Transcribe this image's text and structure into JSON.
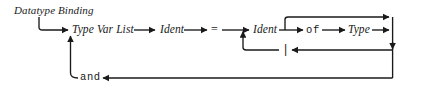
{
  "diagram": {
    "title": "Datatype Binding",
    "type": "railroad-syntax-diagram",
    "ink_color": "#1a1a1a",
    "background_color": "#ffffff",
    "nodes": [
      {
        "id": "type-var-list",
        "label": "Type Var List",
        "kind": "nonterminal",
        "x": 72,
        "y": 30
      },
      {
        "id": "ident-name",
        "label": "Ident",
        "kind": "nonterminal",
        "x": 160,
        "y": 30
      },
      {
        "id": "equals",
        "label": "=",
        "kind": "operator",
        "x": 213,
        "y": 30
      },
      {
        "id": "ident-con",
        "label": "Ident",
        "kind": "nonterminal",
        "x": 253,
        "y": 30
      },
      {
        "id": "of",
        "label": "of",
        "kind": "terminal",
        "x": 308,
        "y": 30
      },
      {
        "id": "type",
        "label": "Type",
        "kind": "nonterminal",
        "x": 350,
        "y": 30
      },
      {
        "id": "bar",
        "label": "|",
        "kind": "terminal",
        "x": 285,
        "y": 50
      },
      {
        "id": "and",
        "label": "and",
        "kind": "terminal",
        "x": 85,
        "y": 78
      }
    ],
    "paths": [
      {
        "id": "entry",
        "from": "start-elbow",
        "to": "type-var-list"
      },
      {
        "id": "main-seq",
        "from": "type-var-list",
        "to": "type"
      },
      {
        "id": "of-bypass-loop",
        "from": "ident-con",
        "to": "right-rail"
      },
      {
        "id": "bar-loop",
        "from": "right-rail",
        "to": "ident-con",
        "via": "bar"
      },
      {
        "id": "and-loop",
        "from": "right-rail",
        "to": "type-var-list",
        "via": "and"
      }
    ]
  }
}
